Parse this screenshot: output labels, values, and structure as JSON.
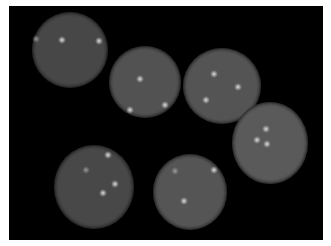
{
  "image": {
    "description": "Fluorescence microscopy image of seven round cells with bright punctate spots on a black background",
    "background_color": "#000000",
    "border_color": "#ffffff"
  },
  "cells": [
    {
      "id": "cell-1",
      "cx": 70,
      "cy": 50,
      "rx": 38,
      "ry": 38,
      "color": "#474747",
      "edge": "#2a2a2a",
      "spots": [
        {
          "x": 36,
          "y": 39,
          "dim": true
        },
        {
          "x": 62,
          "y": 40,
          "dim": false
        },
        {
          "x": 99,
          "y": 41,
          "dim": false
        }
      ]
    },
    {
      "id": "cell-2",
      "cx": 145,
      "cy": 82,
      "rx": 36,
      "ry": 36,
      "color": "#525252",
      "edge": "#2e2e2e",
      "spots": [
        {
          "x": 140,
          "y": 79,
          "dim": false
        },
        {
          "x": 130,
          "y": 110,
          "dim": false
        },
        {
          "x": 165,
          "y": 105,
          "dim": false
        }
      ]
    },
    {
      "id": "cell-3",
      "cx": 222,
      "cy": 86,
      "rx": 39,
      "ry": 38,
      "color": "#545454",
      "edge": "#303030",
      "spots": [
        {
          "x": 214,
          "y": 74,
          "dim": false
        },
        {
          "x": 238,
          "y": 87,
          "dim": false
        },
        {
          "x": 206,
          "y": 100,
          "dim": false
        }
      ]
    },
    {
      "id": "cell-4",
      "cx": 270,
      "cy": 143,
      "rx": 38,
      "ry": 41,
      "color": "#5a5a5a",
      "edge": "#333333",
      "spots": [
        {
          "x": 266,
          "y": 129,
          "dim": false
        },
        {
          "x": 257,
          "y": 140,
          "dim": false
        },
        {
          "x": 267,
          "y": 144,
          "dim": false
        }
      ]
    },
    {
      "id": "cell-5",
      "cx": 94,
      "cy": 187,
      "rx": 40,
      "ry": 42,
      "color": "#484848",
      "edge": "#2a2a2a",
      "spots": [
        {
          "x": 108,
          "y": 155,
          "dim": false
        },
        {
          "x": 86,
          "y": 170,
          "dim": true
        },
        {
          "x": 115,
          "y": 184,
          "dim": false
        },
        {
          "x": 103,
          "y": 193,
          "dim": false
        }
      ]
    },
    {
      "id": "cell-6",
      "cx": 190,
      "cy": 192,
      "rx": 37,
      "ry": 38,
      "color": "#555555",
      "edge": "#303030",
      "spots": [
        {
          "x": 175,
          "y": 171,
          "dim": true
        },
        {
          "x": 214,
          "y": 170,
          "dim": false
        },
        {
          "x": 184,
          "y": 201,
          "dim": false
        }
      ]
    }
  ]
}
